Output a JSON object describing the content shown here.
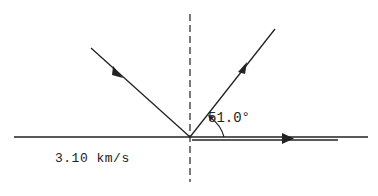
{
  "diagram": {
    "type": "ray-reflection-refraction",
    "colors": {
      "line": "#222222",
      "background": "#ffffff"
    },
    "normal_line": {
      "style": "dashed",
      "x": 190,
      "y1": 14,
      "y2": 182
    },
    "boundary_line": {
      "y": 137,
      "x1": 14,
      "x2": 368
    },
    "incident_ray": {
      "from": [
        91,
        48
      ],
      "to": [
        190,
        137
      ],
      "arrow_direction": "toward-boundary"
    },
    "reflected_ray": {
      "from": [
        190,
        137
      ],
      "to": [
        275,
        29
      ],
      "arrow_direction": "away-from-boundary"
    },
    "critically_refracted_ray": {
      "from": [
        192,
        140
      ],
      "to": [
        338,
        140
      ],
      "arrow_direction": "right"
    },
    "angle_label": "51.0°",
    "speed_label": "3.10 km/s"
  }
}
